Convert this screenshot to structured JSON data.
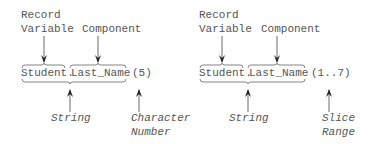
{
  "diagrams": [
    {
      "label_record": "Record",
      "label_variable": "Variable",
      "label_component": "Component",
      "expr_record": "Student.",
      "expr_component": "Last_Name",
      "expr_index": "(5)",
      "label_string": "String",
      "label_index_1": "Character",
      "label_index_2": "Number"
    },
    {
      "label_record": "Record",
      "label_variable": "Variable",
      "label_component": "Component",
      "expr_record": "Student.",
      "expr_component": "Last_Name",
      "expr_index": "(1..7)",
      "label_string": "String",
      "label_index_1": "Slice",
      "label_index_2": "Range"
    }
  ],
  "colors": {
    "text": "#555555",
    "lines": "#333333"
  }
}
